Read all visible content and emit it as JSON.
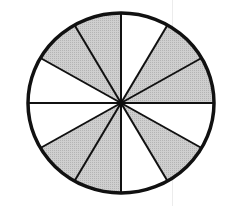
{
  "figure": {
    "sectors_total": 12,
    "sectors_shaded": 7,
    "fraction_shaded": "7/12",
    "shading_pattern_clockwise_from_top": [
      false,
      true,
      true,
      false,
      true,
      false,
      true,
      true,
      false,
      false,
      true,
      true
    ],
    "colors": {
      "shaded": "#c8c8c8",
      "unshaded": "#ffffff",
      "stroke": "#111111"
    },
    "geometry": {
      "cx": 121,
      "cy": 103,
      "rx": 93,
      "ry": 90,
      "stroke_width_outline": 3.5,
      "stroke_width_spokes": 2
    }
  }
}
